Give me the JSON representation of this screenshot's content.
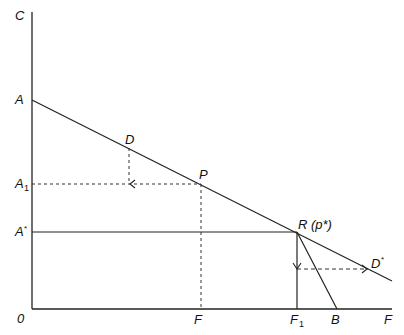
{
  "diagram": {
    "labels": {
      "y_axis": "C",
      "x_axis": "F",
      "origin": "0",
      "A": "A",
      "A1_main": "A",
      "A1_sub": "1",
      "Astar_main": "A",
      "Astar_sup": "*",
      "D": "D",
      "P": "P",
      "R": "R (p*)",
      "Dstar_main": "D",
      "Dstar_sup": "*",
      "F_tick": "F",
      "F1_main": "F",
      "F1_sub": "1",
      "B": "B"
    },
    "colors": {
      "line": "#222222",
      "background": "#ffffff"
    }
  }
}
